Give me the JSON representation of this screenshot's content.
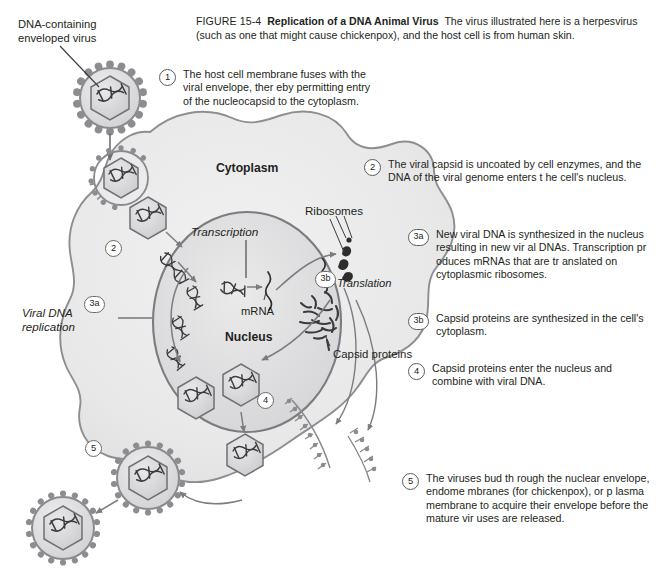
{
  "figure": {
    "number": "FIGURE 15-4",
    "title": "Replication of a DNA Animal Virus",
    "description": "The virus illustrated here is a herpesvirus (such as one that might cause chickenpox), and the host cell is from human skin."
  },
  "steps": [
    {
      "marker": "1",
      "text": "The host cell membrane fuses with the viral envelope, ther eby permitting entry of the nucleocapsid to the cytoplasm."
    },
    {
      "marker": "2",
      "text": "The viral capsid is uncoated by cell enzymes, and the  DNA of the viral genome enters t he cell's nucleus."
    },
    {
      "marker": "3a",
      "text": "New viral DNA is synthesized  in the nucleus resulting in new vir al DNAs. Transcription pr oduces mRNAs that are tr anslated on cytoplasmic ribosomes."
    },
    {
      "marker": "3b",
      "text": "Capsid proteins are synthesized in the cell's cytoplasm."
    },
    {
      "marker": "4",
      "text": "Capsid proteins enter  the nucleus and combine with  viral DNA."
    },
    {
      "marker": "5",
      "text": "The viruses bud th rough the nuclear envelope, endome mbranes (for chickenpox), or p lasma membrane to acquire their  envelope before the mature vir uses are released."
    }
  ],
  "labels": {
    "virus": "DNA-containing enveloped virus",
    "cytoplasm": "Cytoplasm",
    "ribosomes": "Ribosomes",
    "transcription": "Transcription",
    "translation": "Translation",
    "mrna": "mRNA",
    "viral_dna_replication": "Viral DNA replication",
    "nucleus": "Nucleus",
    "capsid_proteins": "Capsid proteins"
  },
  "markers": {
    "m2": "2",
    "m3a": "3a",
    "m3b": "3b",
    "m4": "4",
    "m5": "5"
  },
  "colors": {
    "ink": "#231f20",
    "cell_fill": "#e9e9ea",
    "cell_stroke": "#8e8e92",
    "nucleus_fill": "#dededf",
    "nucleus_stroke": "#7c7c80",
    "capsid_fill": "#d7d7d9",
    "envelope_stroke": "#8a8a8e",
    "spike": "#8d8d91",
    "arrow": "#7b7b80",
    "page_bg": "#ffffff"
  }
}
